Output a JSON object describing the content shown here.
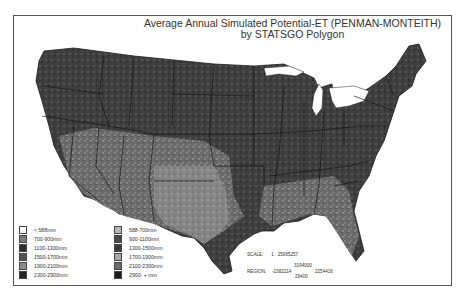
{
  "map": {
    "title_line1": "Average Annual Simulated Potential-ET (PENMAN-MONTEITH)",
    "title_line2": "by STATSGO Polygon",
    "colors": {
      "frame_border": "#555555",
      "background": "#ffffff",
      "land_dark": "#3a3a3a",
      "land_mid": "#5e5e5e",
      "land_light": "#8a8a8a",
      "state_border": "#1a1a1a"
    }
  },
  "legend": {
    "items": [
      {
        "label": "< 588mm",
        "color": "#ffffff"
      },
      {
        "label": "588-700mm",
        "color": "#b8b8b8"
      },
      {
        "label": "700-900mm",
        "color": "#7a7a7a"
      },
      {
        "label": "900-1100mm",
        "color": "#4a4a4a"
      },
      {
        "label": "1100-1300mm",
        "color": "#2e2e2e"
      },
      {
        "label": "1300-1500mm",
        "color": "#3c3c3c"
      },
      {
        "label": "1500-1700mm",
        "color": "#555555"
      },
      {
        "label": "1700-1900mm",
        "color": "#a8a8a8"
      },
      {
        "label": "1900-2100mm",
        "color": "#8c8c8c"
      },
      {
        "label": "2100-2300mm",
        "color": "#6a6a6a"
      },
      {
        "label": "2300-2900mm",
        "color": "#262626"
      },
      {
        "label": "2900- + mm",
        "color": "#1c1c1c"
      }
    ]
  },
  "scale": {
    "label": "SCALE:",
    "value": "1 : 25965257"
  },
  "region": {
    "label": "REGION:",
    "left": "-2382214",
    "top": "3194000",
    "right": "2254416",
    "bottom": "29400"
  }
}
